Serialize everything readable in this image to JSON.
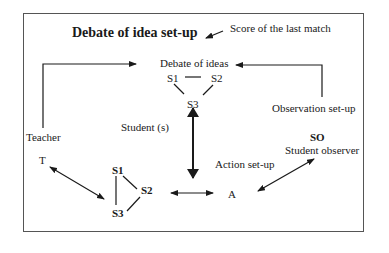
{
  "diagram": {
    "title": "Debate of idea set-up",
    "score_label": "Score of the last match",
    "debate_label": "Debate of ideas",
    "debate_nodes": [
      "S1",
      "S2",
      "S3"
    ],
    "student_label": "Student (s)",
    "observation_label": "Observation set-up",
    "teacher_label": "Teacher",
    "teacher_node": "T",
    "action_nodes": [
      "S1",
      "S2",
      "S3"
    ],
    "action_label": "Action set-up",
    "action_node": "A",
    "so_node": "SO",
    "so_label": "Student observer"
  }
}
